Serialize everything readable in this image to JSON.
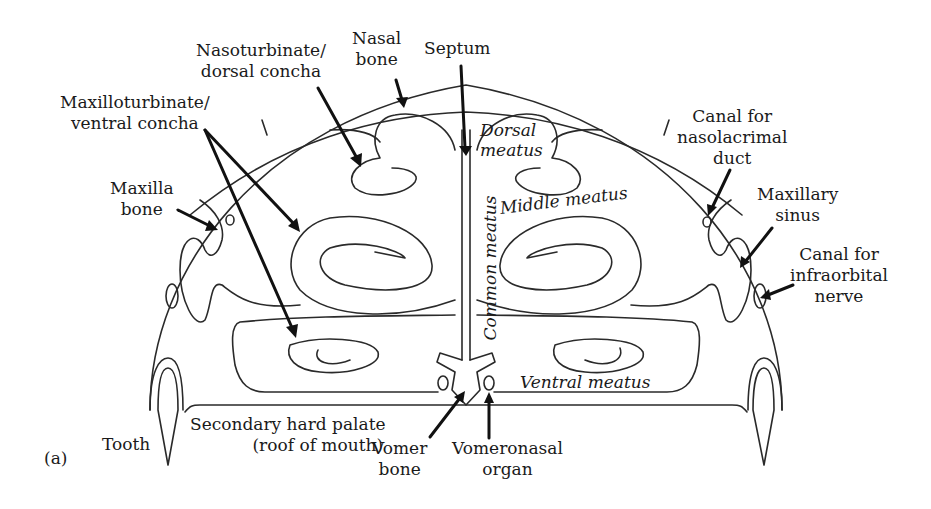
{
  "figure": {
    "panel_label": "(a)",
    "labels": {
      "nasoturbinate": [
        "Nasoturbinate/",
        "dorsal concha"
      ],
      "nasal_bone": [
        "Nasal",
        "bone"
      ],
      "septum": [
        "Septum"
      ],
      "maxilloturbinate": [
        "Maxilloturbinate/",
        "ventral concha"
      ],
      "maxilla_bone": [
        "Maxilla",
        "bone"
      ],
      "canal_nasolacrimal": [
        "Canal for",
        "nasolacrimal",
        "duct"
      ],
      "maxillary_sinus": [
        "Maxillary",
        "sinus"
      ],
      "canal_infraorbital": [
        "Canal for",
        "infraorbital",
        "nerve"
      ],
      "tooth": [
        "Tooth"
      ],
      "hard_palate": [
        "Secondary hard palate",
        "(roof of mouth)"
      ],
      "vomer_bone": [
        "Vomer",
        "bone"
      ],
      "vomeronasal_organ": [
        "Vomeronasal",
        "organ"
      ]
    },
    "regions": {
      "dorsal_meatus": [
        "Dorsal",
        "meatus"
      ],
      "middle_meatus": "Middle meatus",
      "common_meatus": "Common meatus",
      "ventral_meatus": "Ventral meatus"
    }
  }
}
